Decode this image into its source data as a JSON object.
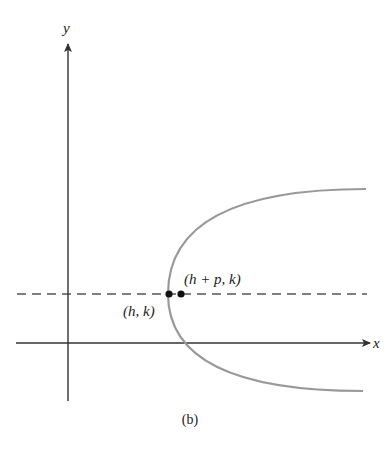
{
  "figure": {
    "caption": "(b)",
    "x_axis_label": "x",
    "y_axis_label": "y",
    "vertex_label": "(h, k)",
    "focus_label": "(h + p, k)",
    "colors": {
      "axes": "#333333",
      "curve": "#999999",
      "dashed_line": "#555555",
      "points": "#111111"
    }
  }
}
